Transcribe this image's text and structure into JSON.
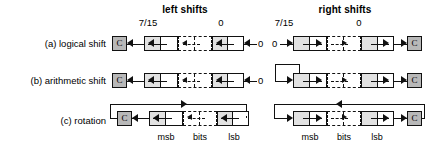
{
  "figure": {
    "column_titles": [
      {
        "label": "left shifts"
      },
      {
        "label": "right shifts"
      }
    ],
    "bit_index_labels": {
      "msb_index": "7/15",
      "lsb_index": "0"
    },
    "rows": [
      {
        "id": "logical",
        "label": "(a) logical shift"
      },
      {
        "id": "arithmetic",
        "label": "(b) arithmetic shift"
      },
      {
        "id": "rotation",
        "label": "(c) rotation"
      }
    ],
    "carry_flag": {
      "label": "C"
    },
    "constants": {
      "zero_in_left": "0",
      "zero_in_right": "0"
    },
    "footer_labels": {
      "msb": "msb",
      "bits": "bits",
      "lsb": "lsb"
    },
    "colors": {
      "carry_fill": "#b8b8b8",
      "cell_half_fill": "#e2e2e2",
      "stroke": "#111111",
      "background": "#ffffff"
    },
    "icons": {
      "shift_left": "arrow-left-icon",
      "shift_right": "arrow-right-icon"
    }
  }
}
